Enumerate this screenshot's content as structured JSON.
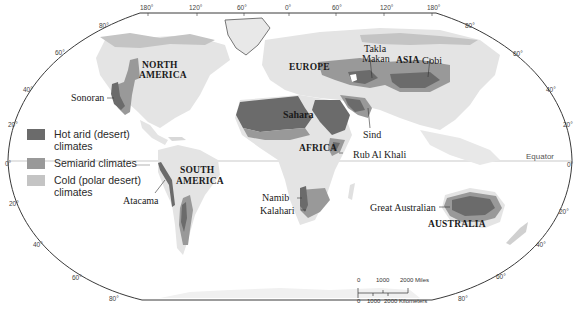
{
  "colors": {
    "background": "#ffffff",
    "land": "#e4e4e4",
    "hot_arid": "#6b6b6b",
    "semiarid": "#999999",
    "cold_polar": "#c4c4c4",
    "border": "#3a3a3a",
    "equator_line": "#bbbbbb"
  },
  "legend": {
    "items": [
      {
        "key": "hot_arid",
        "label_line1": "Hot arid (desert)",
        "label_line2": "climates",
        "color": "#6b6b6b"
      },
      {
        "key": "semiarid",
        "label_line1": "Semiarid climates",
        "label_line2": "",
        "color": "#999999"
      },
      {
        "key": "cold_polar",
        "label_line1": "Cold (polar desert)",
        "label_line2": "climates",
        "color": "#c4c4c4"
      }
    ]
  },
  "continents": {
    "north_america_1": "NORTH",
    "north_america_2": "AMERICA",
    "south_america_1": "SOUTH",
    "south_america_2": "AMERICA",
    "europe": "EUROPE",
    "asia": "ASIA",
    "africa": "AFRICA",
    "australia": "AUSTRALIA"
  },
  "deserts": {
    "sonoran": "Sonoran",
    "atacama": "Atacama",
    "sahara": "Sahara",
    "takla_makan_1": "Takla",
    "takla_makan_2": "Makan",
    "gobi": "Gobi",
    "sind": "Sind",
    "rub_al_khali": "Rub Al Khali",
    "namib": "Namib",
    "kalahari": "Kalahari",
    "great_australian": "Great Australian"
  },
  "equator": {
    "label": "Equator"
  },
  "longitude_ticks": [
    "180°",
    "120°",
    "60°",
    "0°",
    "60°",
    "120°",
    "180°"
  ],
  "latitude_ticks_left": [
    "80°",
    "60°",
    "40°",
    "20°",
    "0°",
    "20°",
    "40°",
    "60°",
    "80°"
  ],
  "latitude_ticks_right": [
    "80°",
    "60°",
    "40°",
    "20°",
    "0°",
    "20°",
    "40°",
    "60°",
    "80°"
  ],
  "scale_bar": {
    "miles_labels": [
      "0",
      "1000",
      "2000 Miles"
    ],
    "km_labels": [
      "0",
      "1000",
      "2000 Kilometers"
    ]
  }
}
